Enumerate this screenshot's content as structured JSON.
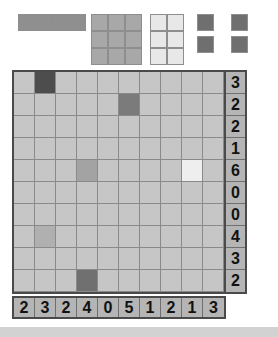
{
  "colors": {
    "empty_cell": "#c6c6c6",
    "grid_line": "#8a8a8a",
    "board_border": "#4a4a4a",
    "clue_background": "#b5b5b5",
    "clue_text": "#121212",
    "piece_border": "#8e8e8e",
    "page_background": "#ffffff",
    "footer": "#d2d2d2",
    "shade_dark": "#4d4d4d",
    "shade_mid_dark": "#7b7b7b",
    "shade_mid": "#a8a8a8",
    "shade_light": "#b9b9b9",
    "shade_very_light": "#eeeeee"
  },
  "piece_tray": {
    "label": "piece-tray",
    "pieces": [
      {
        "name": "bar-1x4",
        "rows": 1,
        "cols": 4,
        "color": "#8f8f8f",
        "left": 18,
        "top": 14
      },
      {
        "name": "block-3x3",
        "rows": 3,
        "cols": 3,
        "color": "#a8a8a8",
        "left": 91,
        "top": 14
      },
      {
        "name": "block-3x2-light",
        "rows": 3,
        "cols": 2,
        "color": "#e8e8e8",
        "left": 150,
        "top": 14
      }
    ],
    "singles": [
      {
        "name": "single-square-1",
        "color": "#6f6f6f",
        "left": 197,
        "top": 14
      },
      {
        "name": "single-square-2",
        "color": "#6f6f6f",
        "left": 231,
        "top": 14
      },
      {
        "name": "single-square-3",
        "color": "#6f6f6f",
        "left": 197,
        "top": 36
      },
      {
        "name": "single-square-4",
        "color": "#6f6f6f",
        "left": 231,
        "top": 36
      }
    ]
  },
  "board": {
    "label": "puzzle-board",
    "rows": 10,
    "cols": 10,
    "row_clues": [
      3,
      2,
      2,
      1,
      6,
      0,
      0,
      4,
      3,
      2
    ],
    "col_clues": [
      2,
      3,
      2,
      4,
      0,
      5,
      1,
      2,
      1,
      3
    ],
    "filled_cells": [
      {
        "row": 0,
        "col": 1,
        "color": "#4d4d4d"
      },
      {
        "row": 1,
        "col": 5,
        "color": "#7b7b7b"
      },
      {
        "row": 4,
        "col": 3,
        "color": "#a3a3a3"
      },
      {
        "row": 4,
        "col": 8,
        "color": "#eeeeee"
      },
      {
        "row": 7,
        "col": 1,
        "color": "#b0b0b0"
      },
      {
        "row": 9,
        "col": 3,
        "color": "#707070"
      }
    ]
  }
}
